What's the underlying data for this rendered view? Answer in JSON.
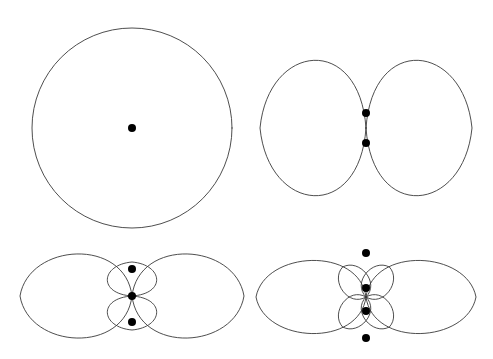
{
  "figure": {
    "width": 493,
    "height": 359,
    "background_color": "#ffffff",
    "curve_color": "#3a3a3a",
    "dot_color": "#000000",
    "curve_stroke_width": 0.9,
    "dot_radius": 4.0,
    "panel_count": 4,
    "layout": "2x2 grid, no axes, no labels, no gridlines, no legend"
  },
  "panels": [
    {
      "id": "panel-top-left",
      "name": "single-element-omnidirectional-pattern",
      "position": "top-left",
      "center": {
        "x": 132,
        "y": 128
      },
      "pattern_type": "circle",
      "lobe_count": 1,
      "description": "Single circular (omnidirectional) radiation pattern",
      "radius": 100,
      "element_count": 1,
      "elements": [
        {
          "x": 132,
          "y": 128
        }
      ],
      "bounds": {
        "left": 32,
        "right": 232,
        "top": 28,
        "bottom": 228
      }
    },
    {
      "id": "panel-top-right",
      "name": "two-element-array-pattern",
      "position": "top-right",
      "center": {
        "x": 366,
        "y": 128
      },
      "pattern_type": "rose",
      "lobe_count": 2,
      "description": "Two-lobed figure-eight pattern from a 2-element array",
      "major_lobe_length": 106,
      "major_lobe_width": 74,
      "element_count": 2,
      "elements": [
        {
          "x": 366,
          "y": 113
        },
        {
          "x": 366,
          "y": 143
        }
      ],
      "bounds": {
        "left": 260,
        "right": 472,
        "top": 90,
        "bottom": 166
      }
    },
    {
      "id": "panel-bottom-left",
      "name": "three-element-array-pattern",
      "position": "bottom-left",
      "center": {
        "x": 132,
        "y": 296
      },
      "pattern_type": "rose",
      "lobe_count": 4,
      "description": "Four-lobe pattern: two large horizontal main lobes and two small vertical side lobes",
      "major_lobe_length": 112,
      "major_lobe_width": 46,
      "minor_lobe_length": 34,
      "minor_lobe_width": 27,
      "element_count": 3,
      "elements": [
        {
          "x": 132,
          "y": 269
        },
        {
          "x": 132,
          "y": 296
        },
        {
          "x": 132,
          "y": 322
        }
      ],
      "bounds": {
        "left": 20,
        "right": 244,
        "top": 258,
        "bottom": 334
      }
    },
    {
      "id": "panel-bottom-right",
      "name": "four-element-array-pattern",
      "position": "bottom-right",
      "center": {
        "x": 366,
        "y": 297
      },
      "pattern_type": "rose",
      "lobe_count": 6,
      "description": "Six-lobe pattern: two large horizontal main lobes and four small diagonal side lobes",
      "major_lobe_length": 110,
      "major_lobe_width": 40,
      "minor_lobe_length": 38,
      "minor_lobe_width": 16,
      "minor_lobe_angles_deg": [
        52,
        128,
        232,
        308
      ],
      "element_count": 4,
      "elements": [
        {
          "x": 366,
          "y": 253
        },
        {
          "x": 366,
          "y": 288
        },
        {
          "x": 366,
          "y": 311
        },
        {
          "x": 366,
          "y": 338
        }
      ],
      "bounds": {
        "left": 258,
        "right": 474,
        "top": 247,
        "bottom": 346
      }
    }
  ],
  "chart_data": {
    "type": "line",
    "title": "",
    "subtitle": "",
    "xlabel": "",
    "ylabel": "",
    "grid": false,
    "legend": false,
    "axes_visible": false,
    "coordinate_system": "polar",
    "subplots": [
      {
        "name": "single-element-omnidirectional-pattern",
        "polar_function": "r(theta) = 1",
        "lobes": 1,
        "normalized_max_radius": 1.0,
        "nulls_deg": [],
        "peaks_deg": [
          0
        ],
        "marker_points": [
          {
            "label": "element-1",
            "x_norm": 0.0,
            "y_norm": 0.0
          }
        ]
      },
      {
        "name": "two-element-array-pattern",
        "polar_function": "r(theta) = |cos(theta/1)| lobed figure-eight",
        "lobes": 2,
        "normalized_max_radius": 1.0,
        "nulls_deg": [
          90,
          270
        ],
        "peaks_deg": [
          0,
          180
        ],
        "marker_points": [
          {
            "label": "element-1",
            "x_norm": 0.0,
            "y_norm": 0.28
          },
          {
            "label": "element-2",
            "x_norm": 0.0,
            "y_norm": -0.28
          }
        ]
      },
      {
        "name": "three-element-array-pattern",
        "polar_function": "main lobes at 0 and 180 deg, side lobes at 90 and 270 deg",
        "lobes": 4,
        "normalized_max_radius": 1.0,
        "side_lobe_level": 0.3,
        "nulls_deg": [
          48,
          132,
          228,
          312
        ],
        "peaks_deg": [
          0,
          90,
          180,
          270
        ],
        "marker_points": [
          {
            "label": "element-1",
            "x_norm": 0.0,
            "y_norm": 0.24
          },
          {
            "label": "element-2",
            "x_norm": 0.0,
            "y_norm": 0.0
          },
          {
            "label": "element-3",
            "x_norm": 0.0,
            "y_norm": -0.24
          }
        ]
      },
      {
        "name": "four-element-array-pattern",
        "polar_function": "main lobes at 0 and 180 deg, four side lobes at diagonal angles",
        "lobes": 6,
        "normalized_max_radius": 1.0,
        "side_lobe_level": 0.35,
        "nulls_deg": [
          30,
          75,
          105,
          150,
          210,
          255,
          285,
          330
        ],
        "peaks_deg": [
          0,
          52,
          128,
          180,
          232,
          308
        ],
        "marker_points": [
          {
            "label": "element-1",
            "x_norm": 0.0,
            "y_norm": 0.4
          },
          {
            "label": "element-2",
            "x_norm": 0.0,
            "y_norm": 0.09
          },
          {
            "label": "element-3",
            "x_norm": 0.0,
            "y_norm": -0.13
          },
          {
            "label": "element-4",
            "x_norm": 0.0,
            "y_norm": -0.37
          }
        ]
      }
    ]
  }
}
